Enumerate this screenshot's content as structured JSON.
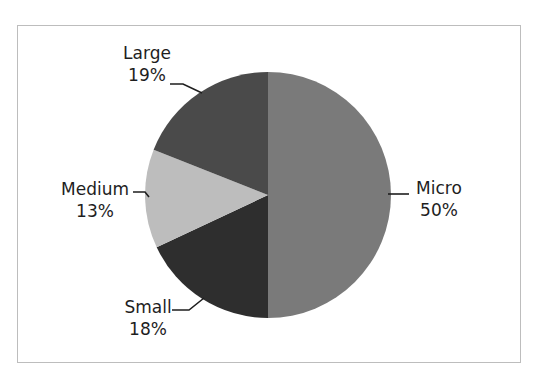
{
  "chart_data": {
    "type": "pie",
    "title": "",
    "categories": [
      "Micro",
      "Small",
      "Medium",
      "Large"
    ],
    "values": [
      50,
      18,
      13,
      19
    ],
    "labels": [
      "Micro\n50%",
      "Small\n18%",
      "Medium\n13%",
      "Large\n19%"
    ],
    "colors": [
      "#7a7a7a",
      "#2e2e2e",
      "#bdbdbd",
      "#4a4a4a"
    ],
    "start_angle": "12 o'clock, clockwise",
    "legend": "none",
    "data_labels": "outside with leader lines"
  },
  "slices": [
    {
      "name": "Micro",
      "pct": "50%",
      "color": "#7a7a7a"
    },
    {
      "name": "Small",
      "pct": "18%",
      "color": "#2e2e2e"
    },
    {
      "name": "Medium",
      "pct": "13%",
      "color": "#bdbdbd"
    },
    {
      "name": "Large",
      "pct": "19%",
      "color": "#4a4a4a"
    }
  ]
}
